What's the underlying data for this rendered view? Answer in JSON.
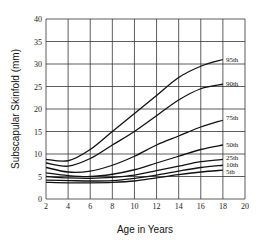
{
  "chart_data": {
    "type": "line",
    "title": "",
    "xlabel": "Age in Years",
    "ylabel": "Subscapular Skinfold (mm)",
    "xlim": [
      2,
      20
    ],
    "ylim": [
      0,
      40
    ],
    "xticks": [
      2,
      4,
      6,
      8,
      10,
      12,
      14,
      16,
      18,
      20
    ],
    "yticks": [
      0,
      5,
      10,
      15,
      20,
      25,
      30,
      35,
      40
    ],
    "grid": true,
    "legend_position": "inline-right-end",
    "x": [
      2,
      4,
      6,
      8,
      10,
      12,
      14,
      16,
      18
    ],
    "series": [
      {
        "name": "95th",
        "values": [
          8.8,
          8.5,
          11,
          15,
          19,
          23,
          27,
          29.5,
          31
        ]
      },
      {
        "name": "90th",
        "values": [
          8,
          7.3,
          9,
          12,
          15,
          18.5,
          22,
          24.5,
          25.5
        ]
      },
      {
        "name": "75th",
        "values": [
          7,
          6,
          6.2,
          7.5,
          9.5,
          12,
          14,
          16,
          17.5
        ]
      },
      {
        "name": "50th",
        "values": [
          5.8,
          5.2,
          5,
          5.5,
          6.5,
          8,
          9.5,
          11,
          12
        ]
      },
      {
        "name": "25th",
        "values": [
          5,
          4.7,
          4.6,
          4.8,
          5.3,
          6.3,
          7.3,
          8.3,
          8.8
        ]
      },
      {
        "name": "10th",
        "values": [
          4.2,
          4.1,
          4,
          4.1,
          4.6,
          5.3,
          6.2,
          7,
          7.5
        ]
      },
      {
        "name": "5th",
        "values": [
          3.7,
          3.6,
          3.6,
          3.7,
          4,
          4.7,
          5.4,
          6,
          6.4
        ]
      }
    ]
  },
  "colors": {
    "grid": "#333333",
    "line": "#111111",
    "background": "#ffffff"
  }
}
